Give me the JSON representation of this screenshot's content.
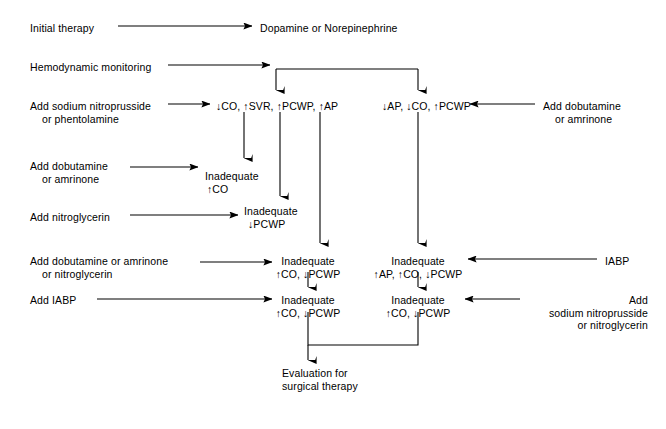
{
  "diagram": {
    "stroke_color": "#000000",
    "background_color": "#ffffff",
    "nodes": [
      {
        "id": "initial-therapy",
        "text": "Initial therapy",
        "x": 30,
        "y": 22,
        "align": "lft"
      },
      {
        "id": "dopamine-norepinephrine",
        "text": "Dopamine or Norepinephrine",
        "x": 260,
        "y": 22,
        "align": "lft"
      },
      {
        "id": "hemodynamic-monitoring",
        "text": "Hemodynamic monitoring",
        "x": 30,
        "y": 61,
        "align": "lft"
      },
      {
        "id": "add-sodium-nitroprusside",
        "line1": "Add sodium nitroprusside",
        "line2": "or phentolamine",
        "x": 30,
        "y": 100,
        "align": "lft",
        "indent2": 12
      },
      {
        "id": "branch-left-state",
        "text": "↓CO, ↑SVR, ↑PCWP, ↑AP",
        "x": 216,
        "y": 100,
        "align": "lft"
      },
      {
        "id": "branch-right-state",
        "text": "↓AP, ↓CO, ↑PCWP",
        "x": 382,
        "y": 100,
        "align": "lft"
      },
      {
        "id": "add-dobutamine-amrinone-right",
        "line1": "Add dobutamine",
        "line2": "or amrinone",
        "x": 543,
        "y": 100,
        "align": "lft",
        "indent2": 12
      },
      {
        "id": "add-dobutamine-amrinone-left",
        "line1": "Add dobutamine",
        "line2": "or amrinone",
        "x": 30,
        "y": 160,
        "align": "lft",
        "indent2": 12
      },
      {
        "id": "inadequate-co",
        "line1": "Inadequate",
        "line2": "↑CO",
        "x": 205,
        "y": 170,
        "align": "lft",
        "indent2": 2
      },
      {
        "id": "add-nitroglycerin",
        "text": "Add nitroglycerin",
        "x": 30,
        "y": 211,
        "align": "lft"
      },
      {
        "id": "inadequate-pcwp",
        "line1": "Inadequate",
        "line2": "↓PCWP",
        "x": 244,
        "y": 205,
        "align": "lft",
        "indent2": 4
      },
      {
        "id": "add-dobutamine-or-nitroglycerin",
        "line1": "Add dobutamine or amrinone",
        "line2": "or nitroglycerin",
        "x": 30,
        "y": 255,
        "align": "lft",
        "indent2": 12
      },
      {
        "id": "inadequate-co-pcwp-a",
        "line1": "Inadequate",
        "line2": "↑CO, ↓PCWP",
        "x": 308,
        "y": 255,
        "align": "ctr"
      },
      {
        "id": "inadequate-ap-co-pcwp",
        "line1": "Inadequate",
        "line2": "↑AP, ↑CO, ↓PCWP",
        "x": 418,
        "y": 255,
        "align": "ctr"
      },
      {
        "id": "iabp-right",
        "text": "IABP",
        "x": 605,
        "y": 255,
        "align": "lft"
      },
      {
        "id": "add-iabp-left",
        "text": "Add IABP",
        "x": 30,
        "y": 294,
        "align": "lft"
      },
      {
        "id": "inadequate-co-pcwp-b",
        "line1": "Inadequate",
        "line2": "↑CO, ↓PCWP",
        "x": 308,
        "y": 294,
        "align": "ctr"
      },
      {
        "id": "inadequate-co-pcwp-c",
        "line1": "Inadequate",
        "line2": "↑CO, ↓PCWP",
        "x": 418,
        "y": 294,
        "align": "ctr"
      },
      {
        "id": "add-sodium-nitroprusside-or-nitroglycerin",
        "line1": "Add",
        "line2": "sodium nitroprusside",
        "line3": "or nitroglycerin",
        "x": 648,
        "y": 294,
        "align": "rgt"
      },
      {
        "id": "evaluation-surgical",
        "line1": "Evaluation for",
        "line2": "surgical therapy",
        "x": 282,
        "y": 367,
        "align": "lft"
      }
    ],
    "connectors": [
      {
        "id": "arrow-initial-to-dopamine",
        "type": "h-arrow",
        "x1": 118,
        "x2": 252,
        "y": 26
      },
      {
        "id": "arrow-hemo-to-branch",
        "type": "h-arrow",
        "x1": 168,
        "x2": 270,
        "y": 65
      },
      {
        "id": "branch-split-bar",
        "type": "split",
        "xs": 276,
        "xm": 276,
        "xe": 418,
        "ytop": 69,
        "ybot": 90
      },
      {
        "id": "arrow-nitroprusside-to-state",
        "type": "h-arrow",
        "x1": 168,
        "x2": 210,
        "y": 104
      },
      {
        "id": "arrow-dobutamine-right-to-state",
        "type": "h-arrow-left",
        "x1": 535,
        "x2": 470,
        "y": 104
      },
      {
        "id": "arrow-state-to-inadequate-co",
        "type": "v-arrow",
        "x": 244,
        "y1": 112,
        "y2": 158
      },
      {
        "id": "arrow-state-to-inadequate-pcwp",
        "type": "v-arrow",
        "x": 280,
        "y1": 112,
        "y2": 196
      },
      {
        "id": "arrow-state-to-inadequate-copcwp",
        "type": "v-arrow",
        "x": 320,
        "y1": 112,
        "y2": 243
      },
      {
        "id": "arrow-rightstate-to-inadequate",
        "type": "v-arrow",
        "x": 418,
        "y1": 112,
        "y2": 243
      },
      {
        "id": "arrow-dobutamine-left-to-node",
        "type": "h-arrow",
        "x1": 130,
        "x2": 198,
        "y": 167
      },
      {
        "id": "arrow-nitroglycerin-to-node",
        "type": "h-arrow",
        "x1": 130,
        "x2": 238,
        "y": 215
      },
      {
        "id": "arrow-dobnitro-to-node",
        "type": "h-arrow",
        "x1": 200,
        "x2": 272,
        "y": 262
      },
      {
        "id": "arrow-iabp-to-node",
        "type": "h-arrow-left",
        "x1": 597,
        "x2": 468,
        "y": 259
      },
      {
        "id": "arrow-mid-a-to-b",
        "type": "v-arrow",
        "x": 308,
        "y1": 272,
        "y2": 287
      },
      {
        "id": "arrow-mid-c-to-d",
        "type": "v-arrow",
        "x": 418,
        "y1": 272,
        "y2": 287
      },
      {
        "id": "arrow-addiabp-to-node",
        "type": "h-arrow",
        "x1": 97,
        "x2": 272,
        "y": 299
      },
      {
        "id": "arrow-addsodium-to-node",
        "type": "h-arrow-left",
        "x1": 520,
        "x2": 465,
        "y": 299
      },
      {
        "id": "merge-to-evaluation",
        "type": "merge",
        "xl": 308,
        "xr": 418,
        "ytop": 312,
        "ybar": 345,
        "xout": 308,
        "ybot": 360
      }
    ]
  }
}
